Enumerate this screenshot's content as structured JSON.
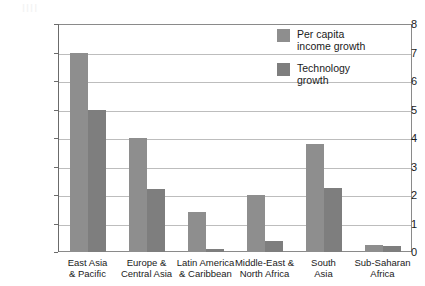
{
  "ghost_text": "IIII",
  "chart_data": {
    "type": "bar",
    "title": "",
    "xlabel": "",
    "ylabel": "",
    "ylim": [
      0,
      8
    ],
    "ytick_labels": [
      "0",
      "1",
      "2",
      "3",
      "4",
      "5",
      "6",
      "7",
      "8"
    ],
    "yticks": [
      0,
      1,
      2,
      3,
      4,
      5,
      6,
      7,
      8
    ],
    "grid": true,
    "legend_position": "inside-top-right",
    "categories": [
      "East Asia\n& Pacific",
      "Europe &\nCentral Asia",
      "Latin America\n& Caribbean",
      "Middle-East &\nNorth Africa",
      "South\nAsia",
      "Sub-Saharan\nAfrica"
    ],
    "category_lines": [
      [
        "East Asia",
        "& Pacific"
      ],
      [
        "Europe &",
        "Central Asia"
      ],
      [
        "Latin America",
        "& Caribbean"
      ],
      [
        "Middle-East &",
        "North Africa"
      ],
      [
        "South",
        "Asia"
      ],
      [
        "Sub-Saharan",
        "Africa"
      ]
    ],
    "series": [
      {
        "name": "Per capita\nincome growth",
        "color": "#8e8e8e",
        "values": [
          7.0,
          4.0,
          1.4,
          2.0,
          3.8,
          0.25
        ]
      },
      {
        "name": "Technology\ngrowth",
        "color": "#7e7e7e",
        "values": [
          5.0,
          2.2,
          0.1,
          0.4,
          2.25,
          0.2
        ]
      }
    ]
  },
  "legend": {
    "items": [
      {
        "label": "Per capita\nincome growth",
        "color": "#8e8e8e"
      },
      {
        "label": "Technology\ngrowth",
        "color": "#7e7e7e"
      }
    ]
  }
}
